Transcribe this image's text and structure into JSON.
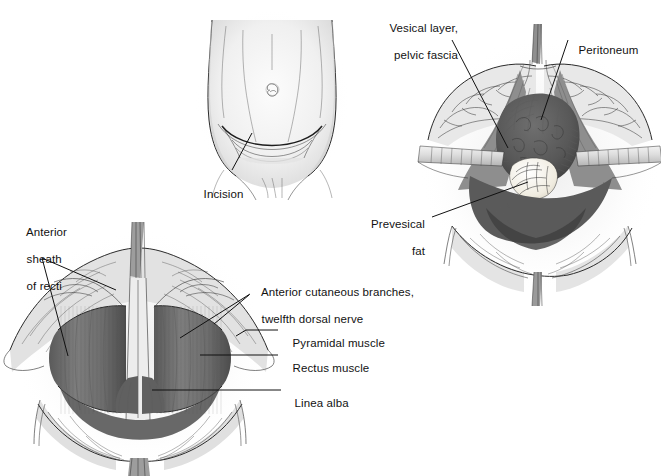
{
  "plate": {
    "title": "Pfannenstiel incision surgical illustration plate",
    "background_color": "#ffffff",
    "ink_color": "#1a1a1a",
    "figures": [
      {
        "id": "fig-abdomen",
        "name": "abdominal-wall-external-view",
        "description": "External view of lower abdomen with umbilicus and curved suprapubic incision line"
      },
      {
        "id": "fig-deep-dissection",
        "name": "deep-pelvic-dissection-view",
        "description": "Deep dissection with retractor blades exposing bladder, peritoneum and prevesical fat"
      },
      {
        "id": "fig-rectus",
        "name": "rectus-muscle-exposure-view",
        "description": "Anterior rectus sheath reflected exposing rectus and pyramidal muscles and linea alba"
      }
    ]
  },
  "labels": {
    "incision": {
      "text": "Incision",
      "lines": [
        "Incision"
      ],
      "align": "left"
    },
    "vesical_layer": {
      "text": "Vesical layer, pelvic fascia",
      "lines": [
        "Vesical layer,",
        "pelvic fascia"
      ],
      "align": "right"
    },
    "peritoneum": {
      "text": "Peritoneum",
      "lines": [
        "Peritoneum"
      ],
      "align": "left"
    },
    "prevesical_fat": {
      "text": "Prevesical fat",
      "lines": [
        "Prevesical",
        "fat"
      ],
      "align": "right"
    },
    "anterior_sheath": {
      "text": "Anterior sheath of recti",
      "lines": [
        "Anterior",
        "sheath",
        "of recti"
      ],
      "align": "left"
    },
    "anterior_cutaneous": {
      "text": "Anterior cutaneous branches, twelfth dorsal nerve",
      "lines": [
        "Anterior cutaneous branches,",
        "twelfth dorsal nerve"
      ],
      "align": "left"
    },
    "pyramidal": {
      "text": "Pyramidal muscle",
      "lines": [
        "Pyramidal muscle"
      ],
      "align": "left"
    },
    "rectus": {
      "text": "Rectus muscle",
      "lines": [
        "Rectus muscle"
      ],
      "align": "left"
    },
    "linea_alba": {
      "text": "Linea alba",
      "lines": [
        "Linea alba"
      ],
      "align": "left"
    }
  },
  "palette": {
    "paper": "#ffffff",
    "skin_light": "#efefef",
    "skin_shade": "#d9d9d9",
    "tissue_mid": "#707070",
    "tissue_dark": "#4a4a4a",
    "tissue_deep": "#353535",
    "fat_cream": "#f2efe6",
    "retractor": "#d7d7d7",
    "line": "#1a1a1a"
  }
}
